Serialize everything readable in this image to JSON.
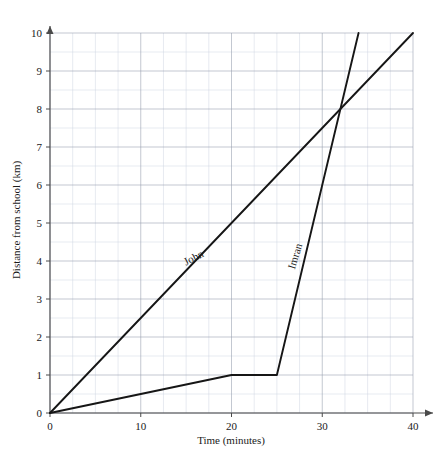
{
  "figure": {
    "background_color": "#ffffff",
    "ink_color": "#161616",
    "grid_major_color": "#9aa3b2",
    "grid_minor_color": "#cfd5e0",
    "axis_color": "#4a4a4a"
  },
  "chart_data": {
    "type": "line",
    "title": "",
    "subtitle": "",
    "xlabel": "Time (minutes)",
    "ylabel": "Distance from school (km)",
    "xlim": [
      0,
      40
    ],
    "ylim": [
      0,
      10
    ],
    "xticks": [
      0,
      10,
      20,
      30,
      40
    ],
    "xtick_labels": [
      "0",
      "10",
      "20",
      "30",
      "40"
    ],
    "yticks": [
      0,
      1,
      2,
      3,
      4,
      5,
      6,
      7,
      8,
      9,
      10
    ],
    "ytick_labels": [
      "0",
      "1",
      "2",
      "3",
      "4",
      "5",
      "6",
      "7",
      "8",
      "9",
      "10"
    ],
    "grid": true,
    "grid_major_x_step": 10,
    "grid_major_y_step": 1,
    "grid_minor_x_step": 2.5,
    "grid_minor_y_step": 0.5,
    "legend": "inline-labels",
    "legend_position": "on-line",
    "axis_arrows": true,
    "series": [
      {
        "name": "John",
        "label": "John",
        "color": "#161616",
        "points": [
          {
            "x": 0,
            "y": 0
          },
          {
            "x": 40,
            "y": 10
          }
        ],
        "label_anchor": {
          "x": 16.0,
          "y": 4.0
        },
        "label_rotation_deg": -27
      },
      {
        "name": "Imran",
        "label": "Imran",
        "color": "#161616",
        "points": [
          {
            "x": 0,
            "y": 0
          },
          {
            "x": 20,
            "y": 1
          },
          {
            "x": 25,
            "y": 1
          },
          {
            "x": 34,
            "y": 10
          }
        ],
        "label_anchor": {
          "x": 27.4,
          "y": 4.1
        },
        "label_rotation_deg": -73
      }
    ],
    "annotations": [
      {
        "text": "intersection",
        "x": 32,
        "y": 8,
        "visible": false
      }
    ]
  },
  "axis_labels": {
    "x_title": "Time (minutes)",
    "y_title": "Distance from school (km)"
  },
  "series_labels": {
    "john": "John",
    "imran": "Imran"
  }
}
